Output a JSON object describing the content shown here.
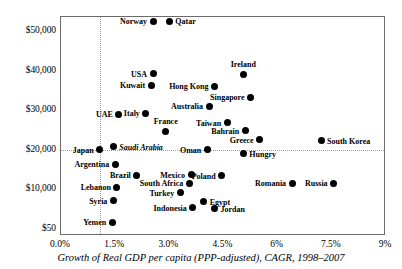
{
  "chart_data": {
    "type": "scatter",
    "title": "",
    "caption": "Growth of Real GDP per capita (PPP-adjusted), CAGR, 1998–2007",
    "xlabel": "Growth of Real GDP per capita (PPP-adjusted), CAGR, 1998–2007",
    "ylabel": "",
    "xticks": [
      "0.0%",
      "1.5%",
      "3.0%",
      "4.5%",
      "6%",
      "7.5%",
      "9%"
    ],
    "xtick_values": [
      0.0,
      1.5,
      3.0,
      4.5,
      6.0,
      7.5,
      9.0
    ],
    "yticks": [
      "$50,000",
      "$40,000",
      "$30,000",
      "$20,000",
      "$10,000",
      "$50"
    ],
    "ytick_values": [
      50000,
      40000,
      30000,
      20000,
      10000,
      50
    ],
    "xlim": [
      0.0,
      9.0
    ],
    "ylim": [
      50,
      55000
    ],
    "grid": "dotted reference lines at x = 1.07% and y = $20,000",
    "legend": "none",
    "reference_lines": {
      "vertical_x": 1.07,
      "horizontal_y": 20000
    },
    "points": [
      {
        "label": "Norway",
        "x": 2.55,
        "y": 52500,
        "pos": "left",
        "italic": false
      },
      {
        "label": "Qatar",
        "x": 3.0,
        "y": 52500,
        "pos": "right",
        "italic": false
      },
      {
        "label": "USA",
        "x": 2.55,
        "y": 39200,
        "pos": "left",
        "italic": false
      },
      {
        "label": "Ireland",
        "x": 5.05,
        "y": 38900,
        "pos": "above",
        "italic": false
      },
      {
        "label": "Kuwait",
        "x": 2.5,
        "y": 36300,
        "pos": "left",
        "italic": false
      },
      {
        "label": "Hong Kong",
        "x": 4.25,
        "y": 36000,
        "pos": "left",
        "italic": false
      },
      {
        "label": "Singapore",
        "x": 5.25,
        "y": 33300,
        "pos": "left",
        "italic": false
      },
      {
        "label": "Australia",
        "x": 4.1,
        "y": 31000,
        "pos": "left",
        "italic": false
      },
      {
        "label": "UAE",
        "x": 1.6,
        "y": 29000,
        "pos": "left",
        "italic": false
      },
      {
        "label": "Italy",
        "x": 2.35,
        "y": 29200,
        "pos": "left",
        "italic": false
      },
      {
        "label": "Taiwan",
        "x": 4.6,
        "y": 26800,
        "pos": "left",
        "italic": false
      },
      {
        "label": "Bahrain",
        "x": 5.1,
        "y": 24800,
        "pos": "left",
        "italic": false
      },
      {
        "label": "France",
        "x": 2.9,
        "y": 24500,
        "pos": "above",
        "italic": false
      },
      {
        "label": "Greece",
        "x": 5.5,
        "y": 22500,
        "pos": "left",
        "italic": false
      },
      {
        "label": "South Korea",
        "x": 7.2,
        "y": 22300,
        "pos": "right",
        "italic": false
      },
      {
        "label": "Saudi Arabia",
        "x": 1.45,
        "y": 20800,
        "pos": "right",
        "italic": true
      },
      {
        "label": "Japan",
        "x": 1.07,
        "y": 20000,
        "pos": "left",
        "italic": false
      },
      {
        "label": "Oman",
        "x": 4.05,
        "y": 20000,
        "pos": "left",
        "italic": false
      },
      {
        "label": "Hungry",
        "x": 5.05,
        "y": 19000,
        "pos": "right",
        "italic": false
      },
      {
        "label": "Argentina",
        "x": 1.5,
        "y": 16300,
        "pos": "left",
        "italic": false
      },
      {
        "label": "Brazil",
        "x": 2.1,
        "y": 13600,
        "pos": "left",
        "italic": false
      },
      {
        "label": "Mexico",
        "x": 3.6,
        "y": 13700,
        "pos": "left",
        "italic": false
      },
      {
        "label": "Poland",
        "x": 4.45,
        "y": 13500,
        "pos": "left",
        "italic": false
      },
      {
        "label": "South Africa",
        "x": 3.55,
        "y": 11500,
        "pos": "left",
        "italic": false
      },
      {
        "label": "Romania",
        "x": 6.4,
        "y": 11500,
        "pos": "left",
        "italic": false
      },
      {
        "label": "Russia",
        "x": 7.55,
        "y": 11500,
        "pos": "left",
        "italic": false
      },
      {
        "label": "Lebanon",
        "x": 1.55,
        "y": 10500,
        "pos": "left",
        "italic": false
      },
      {
        "label": "Turkey",
        "x": 3.3,
        "y": 9200,
        "pos": "left",
        "italic": false
      },
      {
        "label": "Syria",
        "x": 1.45,
        "y": 7200,
        "pos": "left",
        "italic": false
      },
      {
        "label": "Egypt",
        "x": 3.95,
        "y": 6900,
        "pos": "right",
        "italic": false
      },
      {
        "label": "Indonesia",
        "x": 3.65,
        "y": 5400,
        "pos": "left",
        "italic": false
      },
      {
        "label": "Jordan",
        "x": 4.25,
        "y": 5200,
        "pos": "right",
        "italic": false
      },
      {
        "label": "Yemen",
        "x": 1.42,
        "y": 1800,
        "pos": "left",
        "italic": false
      }
    ]
  }
}
